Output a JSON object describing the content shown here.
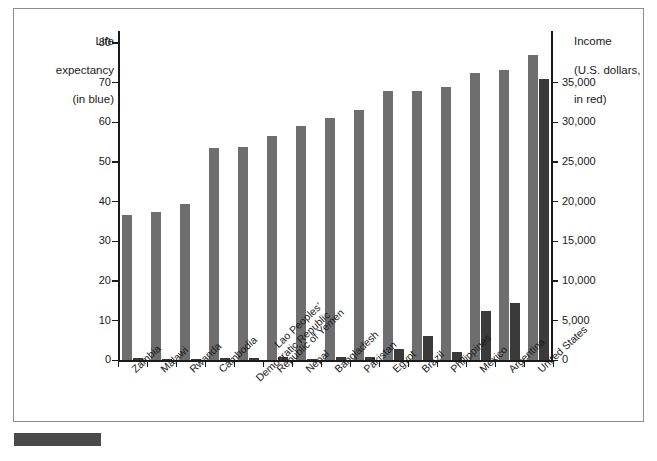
{
  "chart_data": {
    "type": "bar",
    "title": "",
    "subtitle": "",
    "categories": [
      "Zambia",
      "Malawi",
      "Rwanda",
      "Cambodia",
      "Lao Peoples' Democratic Republic",
      "Republic of Yemen",
      "Nepal",
      "Bangladesh",
      "Pakistan",
      "Egypt",
      "Brazil",
      "Philippines",
      "Mexico",
      "Argentina",
      "United States"
    ],
    "category_lines": [
      [
        "Zambia"
      ],
      [
        "Malawi"
      ],
      [
        "Rwanda"
      ],
      [
        "Cambodia"
      ],
      [
        "Lao Peoples'",
        "Democratic Republic"
      ],
      [
        "Republic of Yemen"
      ],
      [
        "Nepal"
      ],
      [
        "Bangladesh"
      ],
      [
        "Pakistan"
      ],
      [
        "Egypt"
      ],
      [
        "Brazil"
      ],
      [
        "Philippines"
      ],
      [
        "Mexico"
      ],
      [
        "Argentina"
      ],
      [
        "United States"
      ]
    ],
    "series": [
      {
        "name": "Life expectancy (in blue)",
        "axis": "left",
        "unit": "years",
        "color": "#6e6e6e",
        "values": [
          36.7,
          37.3,
          39.5,
          53.5,
          53.9,
          56.6,
          59.0,
          61.2,
          63.0,
          68.0,
          67.8,
          68.8,
          72.5,
          73.2,
          77.0
        ]
      },
      {
        "name": "Income (U.S. dollars, in red)",
        "axis": "right",
        "unit": "U.S. dollars",
        "color": "#3a3a3a",
        "values": [
          330,
          170,
          230,
          260,
          320,
          490,
          230,
          370,
          440,
          1490,
          3080,
          1030,
          6230,
          7180,
          35400
        ]
      }
    ],
    "left_axis": {
      "label_lines": [
        "Life",
        "expectancy",
        "(in blue)"
      ],
      "label": "Life expectancy (in blue)",
      "ticks": [
        0,
        10,
        20,
        30,
        40,
        50,
        60,
        70,
        80
      ],
      "tick_labels": [
        "0",
        "10",
        "20",
        "30",
        "40",
        "50",
        "60",
        "70",
        "80"
      ],
      "min": 0,
      "max": 83
    },
    "right_axis": {
      "label_lines": [
        "Income",
        "(U.S. dollars,",
        "in red)"
      ],
      "label": "Income (U.S. dollars, in red)",
      "ticks": [
        0,
        5000,
        10000,
        15000,
        20000,
        25000,
        30000,
        35000
      ],
      "tick_labels": [
        "0",
        "5,000",
        "10,000",
        "15,000",
        "20,000",
        "25,000",
        "30,000",
        "35,000"
      ],
      "min": 0,
      "max": 41500
    },
    "xlabel": "",
    "grid": false,
    "legend_position": "axis-titles"
  },
  "figure": {
    "frame_color": "#8d8d8d",
    "background": "#ffffff",
    "footer_swatch_color": "#4a4a4a"
  }
}
